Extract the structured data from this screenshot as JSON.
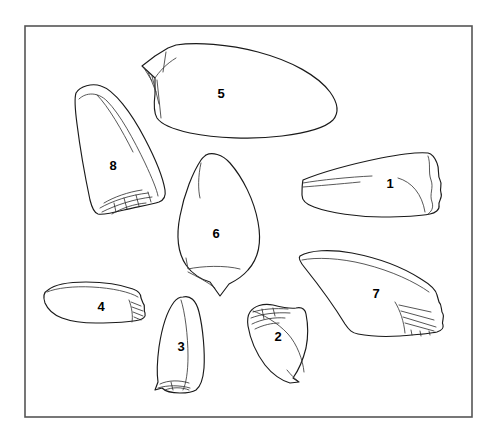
{
  "figure": {
    "kind": "line-drawing-plate",
    "background_color": "#ffffff",
    "frame": {
      "x": 25,
      "y": 26,
      "width": 447,
      "height": 391,
      "stroke_color": "#555555"
    },
    "outline_color": "#1a1a1a",
    "detail_color": "#3a3a3a",
    "label_color": "#000000",
    "artifact_count": 8
  },
  "artifacts": [
    {
      "number": "1",
      "label_x": 390,
      "label_y": 185,
      "description": "elongated triangular flake, tip to left, serrated stepped right margin"
    },
    {
      "number": "2",
      "label_x": 278,
      "label_y": 338,
      "description": "small triangular flake, apex lower right, retouch scars on upper left edge"
    },
    {
      "number": "3",
      "label_x": 181,
      "label_y": 348,
      "description": "elongated ovate point, rounded apex up, retouched base"
    },
    {
      "number": "4",
      "label_x": 101,
      "label_y": 308,
      "description": "short blade-like flake, retouched right end"
    },
    {
      "number": "5",
      "label_x": 221,
      "label_y": 95,
      "description": "large elongated flake, pointed flaked left end, broad rounded right end"
    },
    {
      "number": "6",
      "label_x": 216,
      "label_y": 235,
      "description": "leaf-shaped biface, pointed base, internal ledge line"
    },
    {
      "number": "7",
      "label_x": 376,
      "label_y": 295,
      "description": "elongated flake with hatched step retouch on right end"
    },
    {
      "number": "8",
      "label_x": 113,
      "label_y": 167,
      "description": "tall triangular core tool, scalloped retouched base"
    }
  ]
}
